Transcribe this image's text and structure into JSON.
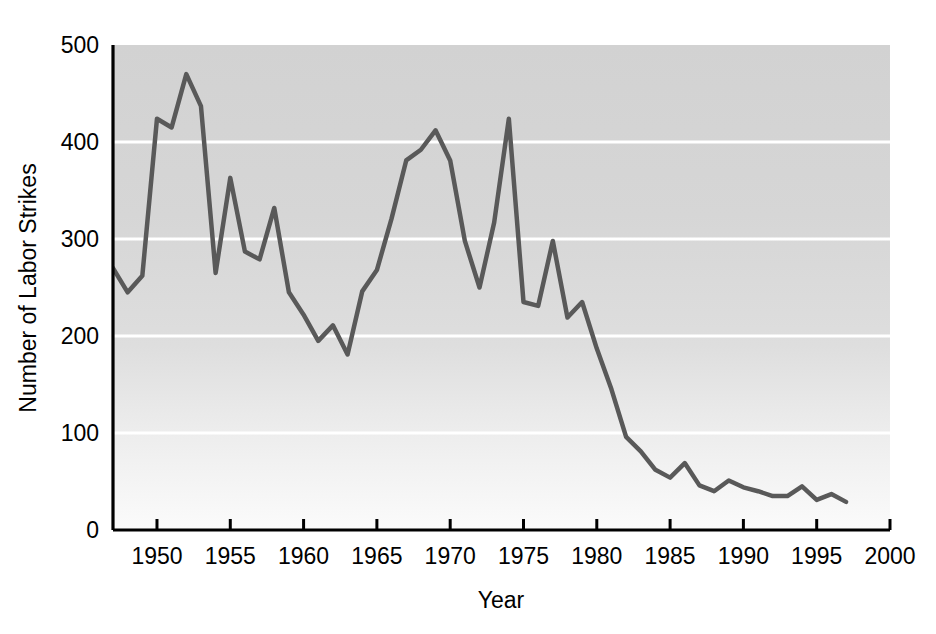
{
  "chart_data": {
    "type": "line",
    "title": "",
    "subtitle": "",
    "xlabel": "Year",
    "ylabel": "Number of Labor Strikes",
    "xlim": [
      1947,
      2000
    ],
    "ylim": [
      0,
      500
    ],
    "xticks": [
      1950,
      1955,
      1960,
      1965,
      1970,
      1975,
      1980,
      1985,
      1990,
      1995,
      2000
    ],
    "xtick_labels": [
      "1950",
      "1955",
      "1960",
      "1965",
      "1970",
      "1975",
      "1980",
      "1985",
      "1990",
      "1995",
      "2000"
    ],
    "yticks": [
      0,
      100,
      200,
      300,
      400,
      500
    ],
    "ytick_labels": [
      "0",
      "100",
      "200",
      "300",
      "400",
      "500"
    ],
    "grid": "horizontal-white",
    "legend": "none",
    "plot_background": "#d4d4d4",
    "plot_background_bottom": "#fafafa",
    "gridline_color": "#ffffff",
    "line_color": "#595959",
    "line_width": 4.5,
    "axis_color": "#000000",
    "series": [
      {
        "name": "Number of Labor Strikes",
        "x": [
          1947,
          1948,
          1949,
          1950,
          1951,
          1952,
          1953,
          1954,
          1955,
          1956,
          1957,
          1958,
          1959,
          1960,
          1961,
          1962,
          1963,
          1964,
          1965,
          1966,
          1967,
          1968,
          1969,
          1970,
          1971,
          1972,
          1973,
          1974,
          1975,
          1976,
          1977,
          1978,
          1979,
          1980,
          1981,
          1982,
          1983,
          1984,
          1985,
          1986,
          1987,
          1988,
          1989,
          1990,
          1991,
          1992,
          1993,
          1994,
          1995,
          1996,
          1997
        ],
        "values": [
          270,
          245,
          262,
          424,
          415,
          470,
          437,
          265,
          363,
          287,
          279,
          332,
          245,
          222,
          195,
          211,
          181,
          246,
          268,
          321,
          381,
          392,
          412,
          381,
          298,
          250,
          317,
          424,
          235,
          231,
          298,
          219,
          235,
          187,
          145,
          96,
          81,
          62,
          54,
          69,
          46,
          40,
          51,
          44,
          40,
          35,
          35,
          45,
          31,
          37,
          29
        ]
      }
    ]
  },
  "axis": {
    "y_title": "Number of Labor Strikes",
    "x_title": "Year"
  }
}
